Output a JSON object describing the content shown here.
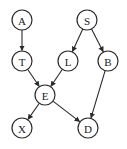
{
  "diagram": {
    "type": "directed-acyclic-graph",
    "node_radius": 10,
    "stroke_color": "#2a2a2a",
    "background": "#ffffff",
    "nodes": [
      {
        "id": "A",
        "label": "A",
        "x": 22,
        "y": 20
      },
      {
        "id": "S",
        "label": "S",
        "x": 87,
        "y": 20
      },
      {
        "id": "T",
        "label": "T",
        "x": 22,
        "y": 61
      },
      {
        "id": "L",
        "label": "L",
        "x": 68,
        "y": 61
      },
      {
        "id": "B",
        "label": "B",
        "x": 108,
        "y": 61
      },
      {
        "id": "E",
        "label": "E",
        "x": 45,
        "y": 95
      },
      {
        "id": "X",
        "label": "X",
        "x": 22,
        "y": 128
      },
      {
        "id": "D",
        "label": "D",
        "x": 88,
        "y": 128
      }
    ],
    "edges": [
      {
        "from": "A",
        "to": "T"
      },
      {
        "from": "S",
        "to": "L"
      },
      {
        "from": "S",
        "to": "B"
      },
      {
        "from": "T",
        "to": "E"
      },
      {
        "from": "L",
        "to": "E"
      },
      {
        "from": "B",
        "to": "D"
      },
      {
        "from": "E",
        "to": "X"
      },
      {
        "from": "E",
        "to": "D"
      }
    ]
  }
}
